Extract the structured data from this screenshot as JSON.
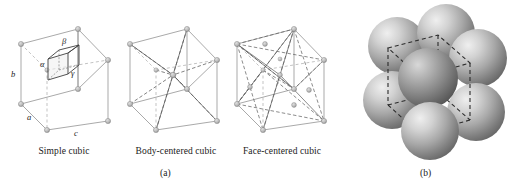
{
  "figure": {
    "panels": [
      {
        "id": "a",
        "label": "(a)",
        "cells": [
          {
            "caption": "Simple cubic",
            "type": "simple-cubic",
            "lattice_points": 8,
            "edge_labels": [
              "a",
              "b",
              "c"
            ],
            "angle_labels": [
              "α",
              "β",
              "γ"
            ],
            "has_inner_cell": true
          },
          {
            "caption": "Body-centered cubic",
            "type": "body-centered-cubic",
            "lattice_points": 9,
            "edge_labels": [],
            "angle_labels": [],
            "has_inner_cell": false
          },
          {
            "caption": "Face-centered cubic",
            "type": "face-centered-cubic",
            "lattice_points": 14,
            "edge_labels": [],
            "angle_labels": [],
            "has_inner_cell": false
          }
        ]
      },
      {
        "id": "b",
        "label": "(b)",
        "caption": "",
        "type": "sphere-packing",
        "sphere_count": 8,
        "cube_outline": "dashed"
      }
    ],
    "colors": {
      "line": "#9a9a9a",
      "dashed": "#aaaaaa",
      "node": "#b9b9b9",
      "node_stroke": "#8c8c8c",
      "inner_line": "#4a4a4a",
      "bcc_diagonal": "#555555",
      "text": "#1a1a1a",
      "sphere_light": "#e8e8e8",
      "sphere_mid": "#b0b0b0",
      "sphere_dark": "#6f6f6f",
      "cube_dash": "#2b2b2b",
      "background": "#ffffff"
    }
  }
}
